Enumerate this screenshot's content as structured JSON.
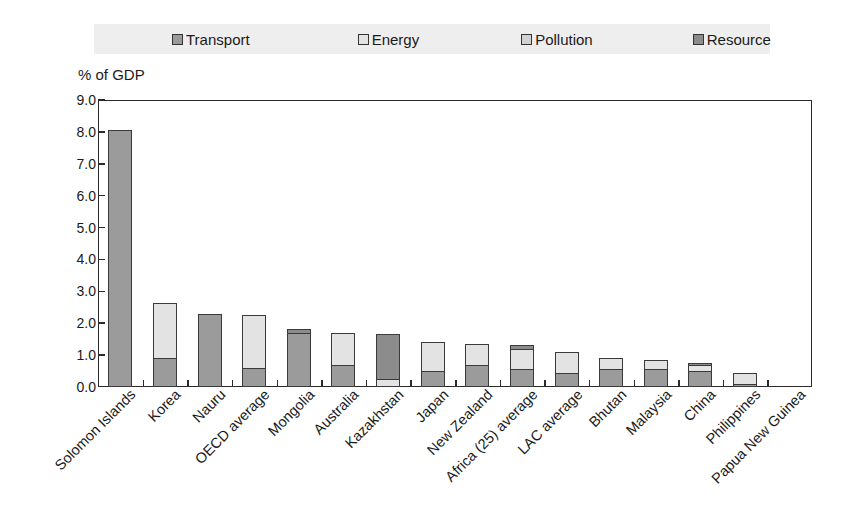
{
  "chart_data": {
    "type": "bar",
    "subtype": "stacked-vertical",
    "title": "",
    "ylabel": "% of GDP",
    "xlabel": "",
    "ylim": [
      0.0,
      9.0
    ],
    "ytick_step": 1.0,
    "ytick_labels": [
      "0.0",
      "1.0",
      "2.0",
      "3.0",
      "4.0",
      "5.0",
      "6.0",
      "7.0",
      "8.0",
      "9.0"
    ],
    "grid": false,
    "legend_position": "top",
    "categories": [
      "Solomon Islands",
      "Korea",
      "Nauru",
      "OECD average",
      "Mongolia",
      "Australia",
      "Kazakhstan",
      "Japan",
      "New Zealand",
      "Africa (25) average",
      "LAC average",
      "Bhutan",
      "Malaysia",
      "China",
      "Philippines",
      "Papua New Guinea"
    ],
    "series": [
      {
        "name": "Transport",
        "color": "#9b9b9b",
        "values": [
          8.05,
          0.9,
          2.3,
          0.6,
          1.7,
          0.7,
          0.0,
          0.5,
          0.7,
          0.55,
          0.45,
          0.55,
          0.55,
          0.5,
          0.1,
          0.0
        ]
      },
      {
        "name": "Energy",
        "color": "#e3e3e3",
        "values": [
          0.0,
          1.75,
          0.0,
          1.67,
          0.0,
          1.0,
          0.25,
          0.9,
          0.65,
          0.65,
          0.65,
          0.35,
          0.3,
          0.2,
          0.35,
          0.0
        ]
      },
      {
        "name": "Pollution",
        "color": "#d2d2d2",
        "values": [
          0.0,
          0.0,
          0.0,
          0.0,
          0.0,
          0.0,
          0.0,
          0.0,
          0.0,
          0.0,
          0.0,
          0.0,
          0.0,
          0.0,
          0.0,
          0.0
        ]
      },
      {
        "name": "Resource",
        "color": "#8c8c8c",
        "values": [
          0.0,
          0.0,
          0.0,
          0.0,
          0.12,
          0.0,
          1.4,
          0.0,
          0.0,
          0.12,
          0.0,
          0.0,
          0.0,
          0.05,
          0.0,
          0.0
        ]
      }
    ],
    "totals": [
      8.05,
      2.65,
      2.3,
      2.27,
      1.82,
      1.7,
      1.65,
      1.4,
      1.35,
      1.32,
      1.1,
      0.9,
      0.85,
      0.75,
      0.45,
      0.0
    ]
  },
  "legend": {
    "items": [
      {
        "label": "Transport",
        "color": "#9b9b9b"
      },
      {
        "label": "Energy",
        "color": "#e3e3e3"
      },
      {
        "label": "Pollution",
        "color": "#d2d2d2"
      },
      {
        "label": "Resource",
        "color": "#8c8c8c"
      }
    ]
  },
  "axis": {
    "y_title": "% of GDP"
  },
  "colors": {
    "background": "#ffffff",
    "legend_background": "#eeeeee",
    "axis_line": "#2a2a2a",
    "text": "#1a1a1a",
    "bar_outline": "#3a3a3a"
  }
}
